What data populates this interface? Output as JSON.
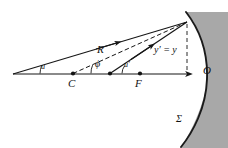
{
  "figure": {
    "type": "optics-ray-diagram",
    "background": "#ffffff",
    "ink_color": "#161616",
    "mirror_fill": "#a8a8a8",
    "mirror_edge": "#1a1a1a"
  },
  "geometry": {
    "axis": {
      "x1": 13,
      "y1": 74,
      "x2": 191,
      "y2": 74
    },
    "object_vertex": {
      "x": 13,
      "y": 74
    },
    "convergence_point": {
      "x": 187,
      "y": 22
    },
    "center_of_curvature": {
      "x": 73,
      "y": 73.5
    },
    "mid_point": {
      "x": 110,
      "y": 73.5
    },
    "focus_point": {
      "x": 140,
      "y": 73.5
    },
    "mirror_vertex": {
      "x": 191,
      "y": 74
    },
    "dashed_height_line": {
      "x": 187,
      "y_top": 24,
      "y_bottom": 73
    },
    "mirror_arc": {
      "top_x": 186,
      "top_y": 12,
      "bottom_x": 181,
      "bottom_y": 146,
      "bulge_x": 207
    },
    "gray_panel": {
      "left": 186,
      "top": 12,
      "right": 228,
      "bottom": 148
    }
  },
  "labels": {
    "angle_u": "u",
    "angle_phi": "ϕ",
    "angle_u_prime": "u′",
    "radius": "R",
    "center": "C",
    "focus": "F",
    "height": "y′ = y",
    "vertex": "O",
    "surface": "Σ"
  },
  "label_positions": {
    "angle_u": {
      "x": 41,
      "y": 63,
      "size": 8
    },
    "angle_phi": {
      "x": 95,
      "y": 61,
      "size": 10
    },
    "angle_u_prime": {
      "x": 124,
      "y": 62,
      "size": 8
    },
    "radius": {
      "x": 97,
      "y": 45,
      "size": 11
    },
    "center": {
      "x": 68,
      "y": 79,
      "size": 11
    },
    "focus": {
      "x": 135,
      "y": 79,
      "size": 11
    },
    "height": {
      "x": 155,
      "y": 45,
      "size": 10
    },
    "vertex": {
      "x": 203,
      "y": 66,
      "size": 11
    },
    "surface": {
      "x": 176,
      "y": 116,
      "size": 10
    }
  }
}
